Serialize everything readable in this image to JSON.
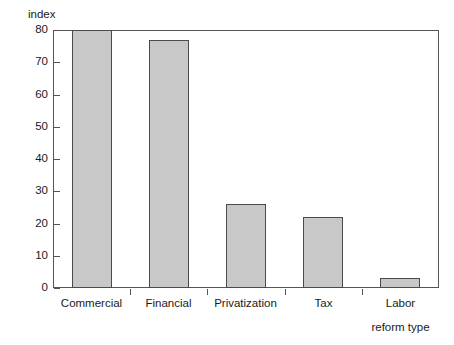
{
  "chart_data": {
    "type": "bar",
    "title": "",
    "xlabel": "reform type",
    "ylabel": "index",
    "categories": [
      "Commercial",
      "Financial",
      "Privatization",
      "Tax",
      "Labor"
    ],
    "values": [
      80,
      77,
      26,
      22,
      3
    ],
    "ylim": [
      0,
      80
    ],
    "yticks": [
      0,
      10,
      20,
      30,
      40,
      50,
      60,
      70,
      80
    ],
    "ytick_labels": [
      "0",
      "10",
      "20",
      "30",
      "40",
      "50",
      "60",
      "70",
      "80"
    ],
    "grid": false,
    "legend": false,
    "legend_position": "none",
    "bar_fill_color": "#c8c8c8",
    "bar_edge_color": "#4a4a4a",
    "axis_color": "#555555",
    "background_color": "#ffffff"
  }
}
